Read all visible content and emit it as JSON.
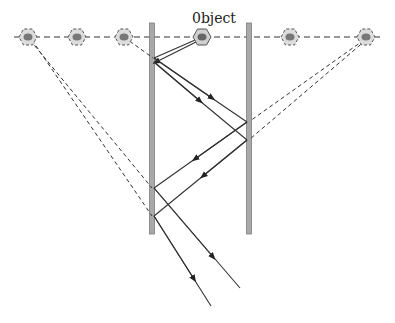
{
  "labels": {
    "object": "0bject"
  },
  "colors": {
    "mirror_fill": "#a9a9a9",
    "mirror_edge": "#7d7d7d",
    "ray": "#333333",
    "dashed": "#333333",
    "object_fill": "#d8d8d8",
    "object_core": "#7a7a7a"
  },
  "elements": {
    "mirrors": [
      {
        "name": "left-mirror",
        "x": 152,
        "y1": 23,
        "y2": 234
      },
      {
        "name": "right-mirror",
        "x": 249,
        "y1": 23,
        "y2": 234
      }
    ],
    "object": {
      "x": 202,
      "y": 37
    },
    "images": [
      {
        "x": 28,
        "y": 37
      },
      {
        "x": 77,
        "y": 37
      },
      {
        "x": 124,
        "y": 37
      },
      {
        "x": 290,
        "y": 37
      },
      {
        "x": 366,
        "y": 37
      }
    ]
  }
}
